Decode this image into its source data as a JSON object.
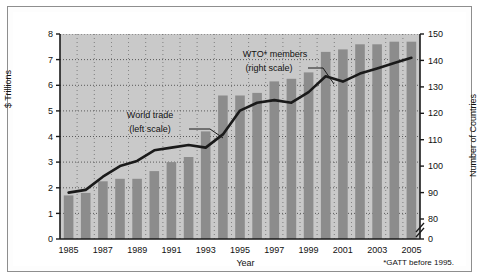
{
  "figure": {
    "y_axis_left_title": "$ Trillions",
    "y_axis_right_title": "Number of Countries",
    "x_axis_title": "Year",
    "footnote": "*GATT before 1995.",
    "annotation_bars": "World trade",
    "annotation_bars_scale": "(left scale)",
    "annotation_line": "WTO* members",
    "annotation_line_scale": "(right scale)",
    "colors": {
      "panel_background": "#c9c9c9",
      "bar_fill": "#8c8c8c",
      "line_stroke": "#1a1a1a",
      "axis": "#1a1a1a",
      "grid": "#4d4d4d",
      "card_border": "#8e8e8e",
      "page_background": "#ffffff"
    }
  },
  "chart_data": {
    "type": "bar",
    "title": "",
    "xlabel": "Year",
    "ylabel": "$ Trillions",
    "ylabel_right": "Number of Countries",
    "grid": true,
    "legend": "inline-annotations",
    "categories": [
      "1985",
      "1986",
      "1987",
      "1988",
      "1989",
      "1990",
      "1991",
      "1992",
      "1993",
      "1994",
      "1995",
      "1996",
      "1997",
      "1998",
      "1999",
      "2000",
      "2001",
      "2002",
      "2003",
      "2004",
      "2005"
    ],
    "x_tick_labels": [
      "1985",
      "1987",
      "1989",
      "1991",
      "1993",
      "1995",
      "1997",
      "1999",
      "2001",
      "2003",
      "2005"
    ],
    "y_left_ticks": [
      0,
      1,
      2,
      3,
      4,
      5,
      6,
      7,
      8
    ],
    "ylim_left": [
      0,
      8
    ],
    "y_right_ticks": [
      0,
      80,
      90,
      100,
      110,
      120,
      130,
      140,
      150
    ],
    "ylim_right": [
      80,
      150
    ],
    "y_right_axis_break": true,
    "series": [
      {
        "name": "World trade",
        "scale": "left",
        "type": "bar",
        "unit": "$ Trillions",
        "values": [
          1.7,
          1.8,
          2.25,
          2.35,
          2.35,
          2.65,
          3.0,
          3.2,
          4.2,
          5.6,
          5.6,
          5.7,
          6.15,
          6.25,
          6.5,
          7.3,
          7.4,
          7.6,
          7.6,
          7.7,
          7.7
        ]
      },
      {
        "name": "WTO* members",
        "scale": "right",
        "type": "line",
        "unit": "Number of Countries",
        "values": [
          90,
          91,
          96,
          100,
          102,
          106,
          107,
          108,
          107,
          112,
          121,
          124,
          125,
          124,
          128,
          134,
          132,
          135,
          137,
          139,
          141
        ]
      }
    ]
  }
}
